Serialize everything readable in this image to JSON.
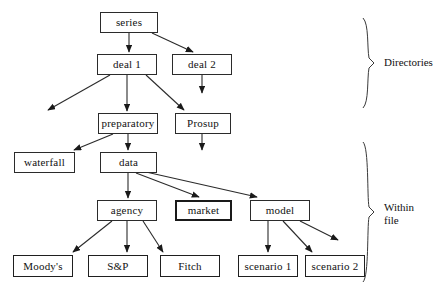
{
  "diagram": {
    "type": "tree",
    "colors": {
      "background": "#ffffff",
      "stroke": "#2b2b2b",
      "text": "#111111"
    },
    "nodes": [
      {
        "id": "series",
        "label": "series",
        "x": 100,
        "y": 12,
        "w": 58,
        "h": 21,
        "weight": "thin"
      },
      {
        "id": "deal1",
        "label": "deal 1",
        "x": 97,
        "y": 54,
        "w": 60,
        "h": 21,
        "weight": "thin"
      },
      {
        "id": "deal2",
        "label": "deal 2",
        "x": 172,
        "y": 54,
        "w": 60,
        "h": 21,
        "weight": "thin"
      },
      {
        "id": "preparatory",
        "label": "preparatory",
        "x": 98,
        "y": 113,
        "w": 60,
        "h": 21,
        "weight": "thin"
      },
      {
        "id": "prosup",
        "label": "Prosup",
        "x": 175,
        "y": 113,
        "w": 56,
        "h": 21,
        "weight": "thin"
      },
      {
        "id": "waterfall",
        "label": "waterfall",
        "x": 14,
        "y": 152,
        "w": 61,
        "h": 21,
        "weight": "thin"
      },
      {
        "id": "data",
        "label": "data",
        "x": 100,
        "y": 152,
        "w": 57,
        "h": 21,
        "weight": "thin"
      },
      {
        "id": "agency",
        "label": "agency",
        "x": 97,
        "y": 200,
        "w": 60,
        "h": 21,
        "weight": "thin"
      },
      {
        "id": "market",
        "label": "market",
        "x": 175,
        "y": 200,
        "w": 57,
        "h": 21,
        "weight": "heavy"
      },
      {
        "id": "model",
        "label": "model",
        "x": 250,
        "y": 200,
        "w": 60,
        "h": 21,
        "weight": "thin"
      },
      {
        "id": "moodys",
        "label": "Moody's",
        "x": 13,
        "y": 255,
        "w": 60,
        "h": 22,
        "weight": "medium"
      },
      {
        "id": "snp",
        "label": "S&P",
        "x": 88,
        "y": 255,
        "w": 60,
        "h": 22,
        "weight": "medium"
      },
      {
        "id": "fitch",
        "label": "Fitch",
        "x": 160,
        "y": 255,
        "w": 60,
        "h": 22,
        "weight": "medium"
      },
      {
        "id": "scenario1",
        "label": "scenario 1",
        "x": 238,
        "y": 255,
        "w": 60,
        "h": 22,
        "weight": "medium"
      },
      {
        "id": "scenario2",
        "label": "scenario 2",
        "x": 305,
        "y": 255,
        "w": 60,
        "h": 22,
        "weight": "medium"
      }
    ],
    "edges": [
      {
        "from": "series",
        "to": "deal1",
        "x1": 129,
        "y1": 33,
        "x2": 129,
        "y2": 52
      },
      {
        "from": "series",
        "to": "deal2",
        "x1": 152,
        "y1": 33,
        "x2": 193,
        "y2": 52
      },
      {
        "from": "deal1",
        "to": "unlabeled",
        "x1": 110,
        "y1": 75,
        "x2": 48,
        "y2": 110
      },
      {
        "from": "deal1",
        "to": "preparatory",
        "x1": 127,
        "y1": 75,
        "x2": 127,
        "y2": 111
      },
      {
        "from": "deal1",
        "to": "prosup",
        "x1": 146,
        "y1": 75,
        "x2": 184,
        "y2": 110
      },
      {
        "from": "deal2",
        "to": "unlabeled",
        "x1": 202,
        "y1": 75,
        "x2": 202,
        "y2": 93
      },
      {
        "from": "preparatory",
        "to": "waterfall",
        "x1": 113,
        "y1": 134,
        "x2": 74,
        "y2": 150
      },
      {
        "from": "preparatory",
        "to": "data",
        "x1": 128,
        "y1": 134,
        "x2": 128,
        "y2": 150
      },
      {
        "from": "prosup",
        "to": "unlabeled",
        "x1": 202,
        "y1": 134,
        "x2": 202,
        "y2": 150
      },
      {
        "from": "data",
        "to": "agency",
        "x1": 128,
        "y1": 173,
        "x2": 128,
        "y2": 198
      },
      {
        "from": "data",
        "to": "market",
        "x1": 136,
        "y1": 173,
        "x2": 199,
        "y2": 197
      },
      {
        "from": "data",
        "to": "model",
        "x1": 146,
        "y1": 172,
        "x2": 257,
        "y2": 197
      },
      {
        "from": "agency",
        "to": "moodys",
        "x1": 112,
        "y1": 221,
        "x2": 73,
        "y2": 252
      },
      {
        "from": "agency",
        "to": "snp",
        "x1": 127,
        "y1": 221,
        "x2": 127,
        "y2": 252
      },
      {
        "from": "agency",
        "to": "fitch",
        "x1": 143,
        "y1": 221,
        "x2": 163,
        "y2": 252
      },
      {
        "from": "model",
        "to": "scenario1",
        "x1": 268,
        "y1": 221,
        "x2": 268,
        "y2": 252
      },
      {
        "from": "model",
        "to": "scenario2",
        "x1": 283,
        "y1": 221,
        "x2": 312,
        "y2": 252
      },
      {
        "from": "model",
        "to": "unlabeled",
        "x1": 300,
        "y1": 221,
        "x2": 338,
        "y2": 240
      }
    ],
    "braces": [
      {
        "id": "directories",
        "label": "Directories",
        "top": 18,
        "bottom": 108,
        "x": 368,
        "label_x": 384,
        "label_y": 56
      },
      {
        "id": "within-file",
        "label": "Within\nfile",
        "top": 142,
        "bottom": 282,
        "x": 368,
        "label_x": 384,
        "label_y": 201
      }
    ]
  }
}
